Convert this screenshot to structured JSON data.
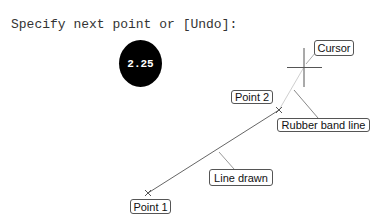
{
  "command_line": {
    "prompt_text": "Specify next point or [Undo]:"
  },
  "dynamic_input": {
    "value": "2.25"
  },
  "annotations": {
    "cursor": "Cursor",
    "point2": "Point 2",
    "rubber_band": "Rubber band line",
    "line_drawn": "Line drawn",
    "point1": "Point 1"
  },
  "geometry": {
    "point1": {
      "x": 148,
      "y": 193
    },
    "point2": {
      "x": 279,
      "y": 110
    },
    "cursor": {
      "x": 304,
      "y": 67
    }
  },
  "colors": {
    "line_drawn": "#666666",
    "rubber_band": "#c8c8c8",
    "crosshair": "#555555",
    "leader": "#999999",
    "badge_bg": "#000000",
    "badge_text": "#ffffff"
  },
  "icons": {
    "crosshair": "crosshair-cursor-icon",
    "point_marker": "x-marker-icon"
  }
}
